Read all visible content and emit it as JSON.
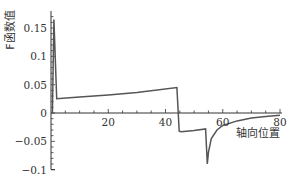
{
  "chart_data": {
    "type": "line",
    "title": "",
    "xlabel": "轴向位置",
    "ylabel": "F函数值",
    "xlim": [
      0,
      80
    ],
    "ylim": [
      -0.1,
      0.18
    ],
    "grid": false,
    "legend": null,
    "x_ticks": [
      20,
      40,
      60,
      80
    ],
    "x_tick_labels": [
      "20",
      "40",
      "60",
      "80"
    ],
    "y_ticks": [
      -0.1,
      -0.05,
      0,
      0.05,
      0.1,
      0.15
    ],
    "y_tick_labels": [
      "−0.1",
      "−0.05",
      "0",
      "0.05",
      "0.1",
      "0.15"
    ],
    "series": [
      {
        "name": "F",
        "color": "#555555",
        "x": [
          0.5,
          1.0,
          2.0,
          10,
          20,
          30,
          44.0,
          44.8,
          45.5,
          50,
          54.0,
          54.6,
          55.0,
          56,
          58,
          60,
          65,
          70,
          75,
          80
        ],
        "y": [
          0.0,
          0.165,
          0.025,
          0.028,
          0.032,
          0.036,
          0.045,
          -0.032,
          -0.033,
          -0.031,
          -0.028,
          -0.09,
          -0.07,
          -0.045,
          -0.03,
          -0.022,
          -0.014,
          -0.009,
          -0.006,
          -0.004
        ]
      }
    ]
  }
}
